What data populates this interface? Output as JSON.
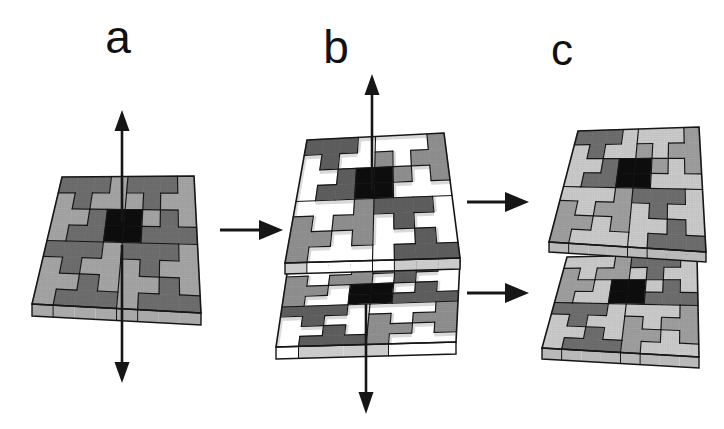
{
  "figure": {
    "background": "#ffffff",
    "panels": [
      {
        "id": "a",
        "label": "a"
      },
      {
        "id": "b",
        "label": "b"
      },
      {
        "id": "c",
        "label": "c"
      }
    ]
  },
  "colors": {
    "edge": "#161616",
    "label_text": "#111111",
    "black_piece": "#0d0d0d",
    "hole": "#ffffff",
    "hole_wall": "#d9d9d9",
    "palette_a": {
      "light": "#a4a4a4",
      "dark": "#6d6d6d",
      "side": "#a9a9a9"
    },
    "palette_b": {
      "light": "#8f8f8f",
      "dark": "#5e5e5e",
      "side": "#cbcbcb"
    },
    "palette_c": {
      "light": "#9e9e9e",
      "dark": "#6d6d6d",
      "backing": "#c9c9c9",
      "side": "#b9b9b9"
    }
  },
  "tile_pattern": {
    "grid_size": 8,
    "block_pieces": {
      "A": [
        [
          0,
          0
        ],
        [
          1,
          0
        ],
        [
          2,
          0
        ],
        [
          1,
          1
        ]
      ],
      "B": [
        [
          3,
          0
        ],
        [
          3,
          1
        ],
        [
          3,
          2
        ],
        [
          2,
          1
        ]
      ],
      "C": [
        [
          0,
          1
        ],
        [
          0,
          2
        ],
        [
          0,
          3
        ],
        [
          1,
          2
        ]
      ],
      "D": [
        [
          2,
          2
        ],
        [
          1,
          3
        ],
        [
          2,
          3
        ],
        [
          3,
          3
        ]
      ]
    },
    "blocks": [
      [
        0,
        0
      ],
      [
        1,
        0
      ],
      [
        0,
        1
      ],
      [
        1,
        1
      ]
    ],
    "piece_shades": {
      "A": "dark",
      "B": "light",
      "C": "light",
      "D": "dark"
    },
    "black_cells": [
      [
        3,
        2
      ],
      [
        4,
        2
      ],
      [
        3,
        3
      ],
      [
        4,
        3
      ]
    ],
    "split_sets": {
      "top": [
        "b0A",
        "b0D",
        "b1B",
        "b1C",
        "b2B",
        "b2C",
        "b3A",
        "b3D"
      ],
      "bottom": [
        "b0B",
        "b0C",
        "b1A",
        "b1D",
        "b2A",
        "b2D",
        "b3B",
        "b3C"
      ]
    }
  },
  "arrows": [
    {
      "name": "tile-a-up-arrow-icon",
      "direction": "up"
    },
    {
      "name": "tile-a-down-arrow-icon",
      "direction": "down"
    },
    {
      "name": "tile-b-up-arrow-icon",
      "direction": "up"
    },
    {
      "name": "tile-b-down-arrow-icon",
      "direction": "down"
    },
    {
      "name": "a-to-b-arrow-icon",
      "direction": "right"
    },
    {
      "name": "b-to-c-upper-arrow-icon",
      "direction": "right"
    },
    {
      "name": "b-to-c-lower-arrow-icon",
      "direction": "right"
    }
  ]
}
